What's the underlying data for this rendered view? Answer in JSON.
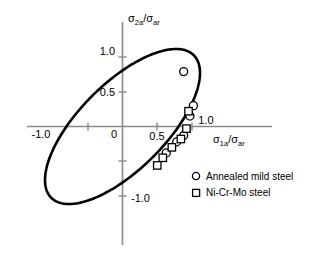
{
  "chart_data": {
    "type": "scatter",
    "title": "",
    "subtitle": "",
    "xlabel": "σ_1a/σ_ar",
    "ylabel": "σ_2a/σ_ar",
    "xlabel_parts": {
      "sigma": "σ",
      "sub": "1a",
      "slash": "/σ",
      "sub2": "ar"
    },
    "ylabel_parts": {
      "sigma": "σ",
      "sub": "2a",
      "slash": "/σ",
      "sub2": "ar"
    },
    "xlim": [
      -1.35,
      1.45
    ],
    "ylim": [
      -1.45,
      1.35
    ],
    "grid": false,
    "legend_position": "lower-right",
    "x_tick_labels": [
      "-1.0",
      "0",
      "0.5",
      "1.0"
    ],
    "x_tick_values": [
      -1.0,
      0,
      0.5,
      1.0
    ],
    "x_tick_minor_values": [
      -0.5
    ],
    "y_tick_labels": [
      "1.0",
      "0.5",
      "-1.0"
    ],
    "y_tick_values": [
      1.0,
      0.5,
      -1.0
    ],
    "y_tick_minor_values": [
      -0.5
    ],
    "envelope": {
      "name": "Gough ellipse failure envelope",
      "shape": "ellipse",
      "center": [
        0.0,
        0.0
      ],
      "semi_major": 1.45,
      "semi_minor": 0.62,
      "rotation_deg": 45.0
    },
    "series": [
      {
        "name": "Annealed mild steel",
        "marker": "circle",
        "points": [
          [
            0.88,
            0.79
          ],
          [
            1.02,
            0.3
          ],
          [
            0.97,
            0.15
          ],
          [
            0.88,
            -0.13
          ],
          [
            0.78,
            -0.22
          ],
          [
            0.63,
            -0.38
          ]
        ]
      },
      {
        "name": "Ni-Cr-Mo steel",
        "marker": "square",
        "points": [
          [
            0.95,
            0.22
          ],
          [
            0.92,
            -0.03
          ],
          [
            0.84,
            -0.18
          ],
          [
            0.71,
            -0.3
          ],
          [
            0.58,
            -0.45
          ],
          [
            0.5,
            -0.56
          ]
        ]
      }
    ]
  },
  "legend": {
    "items": [
      {
        "marker": "circle",
        "label": "Annealed mild steel"
      },
      {
        "marker": "square",
        "label": "Ni-Cr-Mo steel"
      }
    ]
  },
  "colors": {
    "curve": "#000000",
    "axis": "#8a8a8a",
    "text": "#000000",
    "background": "#ffffff",
    "marker_fill": "#ffffff"
  }
}
